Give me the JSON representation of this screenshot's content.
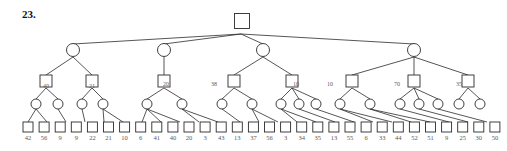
{
  "problem": {
    "number_label": "23."
  },
  "style": {
    "stroke": "#2b2b2b",
    "node_fill": "#ffffff",
    "text_color": "#5a5a5a",
    "label_color": "#111111"
  },
  "diagram": {
    "type": "game-tree",
    "root": {
      "shape": "square",
      "x": 242,
      "y": 21
    },
    "level2_circles": [
      {
        "x": 73,
        "y": 50
      },
      {
        "x": 164,
        "y": 50
      },
      {
        "x": 263,
        "y": 50
      },
      {
        "x": 414,
        "y": 50
      }
    ],
    "level3_squares": [
      {
        "x": 46,
        "y": 81
      },
      {
        "x": 92,
        "y": 81
      },
      {
        "x": 164,
        "y": 81
      },
      {
        "x": 234,
        "y": 81
      },
      {
        "x": 292,
        "y": 81
      },
      {
        "x": 352,
        "y": 81
      },
      {
        "x": 414,
        "y": 81
      },
      {
        "x": 468,
        "y": 81
      }
    ],
    "level4_circles": [
      {
        "x": 36,
        "y": 104
      },
      {
        "x": 58,
        "y": 104
      },
      {
        "x": 82,
        "y": 104
      },
      {
        "x": 103,
        "y": 104
      },
      {
        "x": 147,
        "y": 104
      },
      {
        "x": 182,
        "y": 104
      },
      {
        "x": 222,
        "y": 104
      },
      {
        "x": 252,
        "y": 104
      },
      {
        "x": 281,
        "y": 104
      },
      {
        "x": 299,
        "y": 104
      },
      {
        "x": 316,
        "y": 104
      },
      {
        "x": 340,
        "y": 104
      },
      {
        "x": 370,
        "y": 104
      },
      {
        "x": 400,
        "y": 104
      },
      {
        "x": 419,
        "y": 104
      },
      {
        "x": 438,
        "y": 104
      },
      {
        "x": 459,
        "y": 104
      },
      {
        "x": 480,
        "y": 104
      }
    ],
    "leaves": [
      {
        "value": "42",
        "x": 28
      },
      {
        "value": "56",
        "x": 47
      },
      {
        "value": "9",
        "x": 66
      },
      {
        "value": "9",
        "x": 85
      },
      {
        "value": "22",
        "x": 104
      },
      {
        "value": "21",
        "x": 123
      },
      {
        "value": "10",
        "x": 142
      },
      {
        "value": "6",
        "x": 161
      },
      {
        "value": "41",
        "x": 180
      },
      {
        "value": "40",
        "x": 199
      },
      {
        "value": "20",
        "x": 218
      },
      {
        "value": "3",
        "x": 240
      },
      {
        "value": "43",
        "x": 259
      },
      {
        "value": "13",
        "x": 278
      },
      {
        "value": "37",
        "x": 297
      },
      {
        "value": "56",
        "x": 316
      },
      {
        "value": "3",
        "x": 335
      },
      {
        "value": "34",
        "x": 354
      },
      {
        "value": "35",
        "x": 373
      },
      {
        "value": "13",
        "x": 392
      },
      {
        "value": "55",
        "x": 411
      },
      {
        "value": "6",
        "x": 430
      },
      {
        "value": "33",
        "x": 449
      },
      {
        "value": "44",
        "x": 468
      },
      {
        "value": "52",
        "x": 487
      }
    ],
    "edge_labels": [
      {
        "text": "40",
        "x": 46,
        "y": 88
      },
      {
        "text": "21",
        "x": 92,
        "y": 88
      },
      {
        "text": "20",
        "x": 166,
        "y": 86
      },
      {
        "text": "38",
        "x": 214,
        "y": 86
      },
      {
        "text": "10",
        "x": 296,
        "y": 86
      },
      {
        "text": "10",
        "x": 330,
        "y": 86
      },
      {
        "text": "70",
        "x": 397,
        "y": 86
      },
      {
        "text": "35",
        "x": 459,
        "y": 86
      }
    ],
    "leaf_row_values": [
      "42",
      "56",
      "9",
      "9",
      "22",
      "21",
      "10",
      "6",
      "41",
      "40",
      "20",
      "3",
      "43",
      "13",
      "37",
      "56",
      "3",
      "34",
      "35",
      "13",
      "55",
      "6",
      "33",
      "44",
      "52",
      "51",
      "9",
      "25",
      "30",
      "50"
    ]
  }
}
